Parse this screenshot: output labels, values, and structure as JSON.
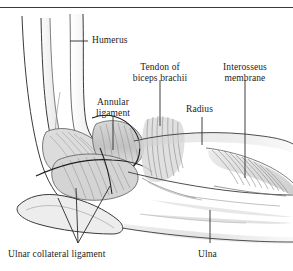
{
  "figure": {
    "type": "anatomical-illustration",
    "style": "grayscale pen-and-ink medical illustration",
    "palette": {
      "background": "#ffffff",
      "ink": "#1c1c1c",
      "outline": "#3a3a3a",
      "bone_shade_light": "#e8e8e8",
      "bone_shade_mid": "#cfcfcf",
      "bone_shade_dark": "#a8a8a8",
      "fiber": "#8d8d8d",
      "leader": "#2a2a2a",
      "rule": "#3a3a3a"
    },
    "top_rule": true
  },
  "labels": [
    {
      "id": "humerus",
      "text": "Humerus",
      "lines": [
        "Humerus"
      ],
      "leader": "horizontal-left"
    },
    {
      "id": "tendon-biceps",
      "text": "Tendon of biceps brachii",
      "lines": [
        "Tendon of",
        "biceps brachii"
      ],
      "leader": "vertical-down"
    },
    {
      "id": "interosseus",
      "text": "Interosseus membrane",
      "lines": [
        "Interosseus",
        "membrane"
      ],
      "leader": "vertical-down"
    },
    {
      "id": "annular",
      "text": "Annular ligament",
      "lines": [
        "Annular",
        "ligament"
      ],
      "leader": "vertical-down"
    },
    {
      "id": "radius",
      "text": "Radius",
      "lines": [
        "Radius"
      ],
      "leader": "vertical-down"
    },
    {
      "id": "ulnar-collateral",
      "text": "Ulnar collateral ligament",
      "lines": [
        "Ulnar collateral ligament"
      ],
      "leader": "three-prong-up"
    },
    {
      "id": "ulna",
      "text": "Ulna",
      "lines": [
        "Ulna"
      ],
      "leader": "vertical-up"
    }
  ],
  "structures": [
    {
      "id": "humerus-shaft",
      "name": "Humerus shaft"
    },
    {
      "id": "medial-epicondyle",
      "name": "Medial epicondyle"
    },
    {
      "id": "annular-ligament",
      "name": "Annular ligament"
    },
    {
      "id": "ulnar-collateral-ligament",
      "name": "Ulnar collateral ligament"
    },
    {
      "id": "biceps-tendon",
      "name": "Tendon of biceps brachii"
    },
    {
      "id": "radius-shaft",
      "name": "Radius"
    },
    {
      "id": "ulna-shaft",
      "name": "Ulna"
    },
    {
      "id": "interosseus-membrane",
      "name": "Interosseus membrane"
    },
    {
      "id": "olecranon",
      "name": "Olecranon"
    }
  ]
}
